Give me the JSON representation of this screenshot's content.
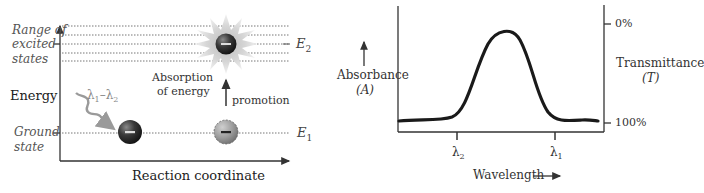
{
  "left_panel": {
    "y_axis_label": "Energy",
    "x_axis_label": "Reaction coordinate",
    "excited_label_lines": [
      "Range of",
      "excited",
      "states"
    ],
    "ground_label_lines": [
      "Ground",
      "state"
    ],
    "e2_label": "E",
    "e2_sub": "2",
    "e1_label": "E",
    "e1_sub": "1",
    "absorption_label_lines": [
      "Absorption",
      "of energy"
    ],
    "promotion_label": "promotion",
    "photon_label": "λ1–λ2",
    "photon_label_parts": {
      "a": "λ",
      "a_sub": "1",
      "dash": "–",
      "b": "λ",
      "b_sub": "2"
    },
    "electron_symbol": "−"
  },
  "right_panel": {
    "left_axis_label": "Absorbance",
    "left_axis_symbol": "(A)",
    "right_axis_label": "Transmittance",
    "right_axis_symbol": "(T)",
    "right_tick_top": "0%",
    "right_tick_bottom": "100%",
    "x_axis_label": "Wavelength",
    "x_tick_1": {
      "symbol": "λ",
      "sub": "2"
    },
    "x_tick_2": {
      "symbol": "λ",
      "sub": "1"
    }
  },
  "colors": {
    "curve": "#1a1a1a",
    "axis": "#333333",
    "photon_arrow": "#9a9a9a",
    "dotted": "#888888"
  }
}
